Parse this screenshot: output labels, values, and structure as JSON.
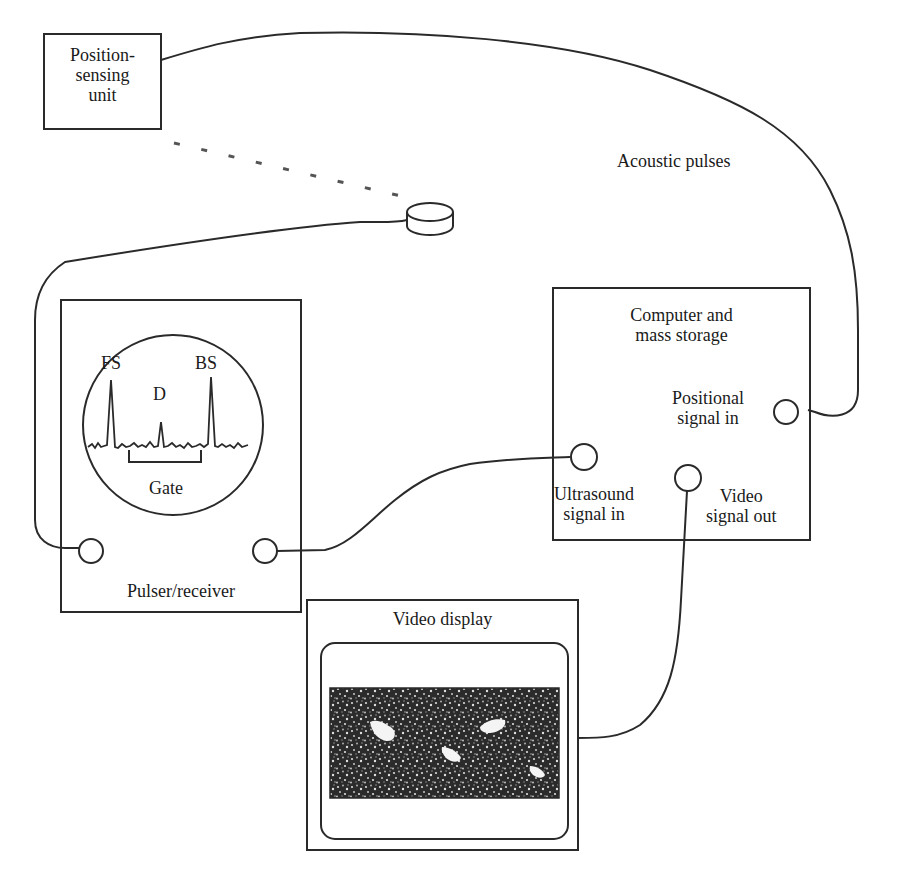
{
  "diagram": {
    "colors": {
      "line": "#2a2a2a",
      "background": "#ffffff",
      "screen_dark": "#2b2b2b"
    },
    "position_sensing_unit": {
      "label_line1": "Position-",
      "label_line2": "sensing",
      "label_line3": "unit"
    },
    "acoustic_pulses": {
      "label": "Acoustic pulses"
    },
    "pulser_receiver": {
      "label": "Pulser/receiver",
      "scope": {
        "peak_fs": "FS",
        "peak_d": "D",
        "peak_bs": "BS",
        "gate_label": "Gate"
      }
    },
    "computer": {
      "label_line1": "Computer and",
      "label_line2": "mass storage",
      "positional_in_line1": "Positional",
      "positional_in_line2": "signal in",
      "ultrasound_in_line1": "Ultrasound",
      "ultrasound_in_line2": "signal in",
      "video_out_line1": "Video",
      "video_out_line2": "signal out"
    },
    "video_display": {
      "label": "Video display"
    }
  }
}
